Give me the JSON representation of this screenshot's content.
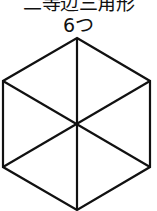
{
  "label": {
    "title": "二等辺三角形",
    "count": "6つ"
  },
  "figure": {
    "shape": "regular-hexagon",
    "subdivision": "6 isosceles triangles from center",
    "stroke_color": "#111111",
    "fill_color": "#ffffff",
    "vertices": {
      "top": [
        77,
        38
      ],
      "upper_right": [
        150,
        81
      ],
      "lower_right": [
        150,
        167
      ],
      "bottom": [
        77,
        210
      ],
      "lower_left": [
        3,
        167
      ],
      "upper_left": [
        3,
        81
      ]
    },
    "center": [
      76,
      124
    ]
  }
}
